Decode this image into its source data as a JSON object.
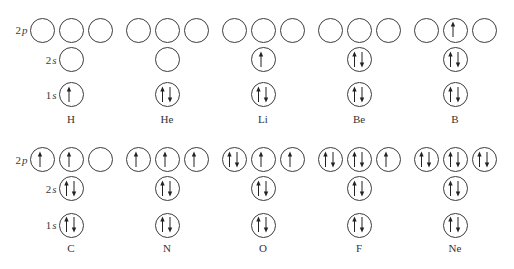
{
  "row_labels": {
    "2p": {
      "n": "2",
      "l": "p"
    },
    "2s": {
      "n": "2",
      "l": "s"
    },
    "1s": {
      "n": "1",
      "l": "s"
    }
  },
  "colors": {
    "circle_stroke": "#3c3c3c",
    "arrow": "#222222",
    "text": "#333333",
    "background": "#ffffff"
  },
  "elements": [
    {
      "symbol": "H",
      "orbitals": {
        "1s": "up",
        "2s": "empty",
        "2p": [
          "empty",
          "empty",
          "empty"
        ]
      }
    },
    {
      "symbol": "He",
      "orbitals": {
        "1s": "updown",
        "2s": "empty",
        "2p": [
          "empty",
          "empty",
          "empty"
        ]
      }
    },
    {
      "symbol": "Li",
      "orbitals": {
        "1s": "updown",
        "2s": "up",
        "2p": [
          "empty",
          "empty",
          "empty"
        ]
      }
    },
    {
      "symbol": "Be",
      "orbitals": {
        "1s": "updown",
        "2s": "updown",
        "2p": [
          "empty",
          "empty",
          "empty"
        ]
      }
    },
    {
      "symbol": "B",
      "orbitals": {
        "1s": "updown",
        "2s": "updown",
        "2p": [
          "empty",
          "up",
          "empty"
        ]
      }
    },
    {
      "symbol": "C",
      "orbitals": {
        "1s": "updown",
        "2s": "updown",
        "2p": [
          "up",
          "up",
          "empty"
        ]
      }
    },
    {
      "symbol": "N",
      "orbitals": {
        "1s": "updown",
        "2s": "updown",
        "2p": [
          "up",
          "up",
          "up"
        ]
      }
    },
    {
      "symbol": "O",
      "orbitals": {
        "1s": "updown",
        "2s": "updown",
        "2p": [
          "updown",
          "up",
          "up"
        ]
      }
    },
    {
      "symbol": "F",
      "orbitals": {
        "1s": "updown",
        "2s": "updown",
        "2p": [
          "updown",
          "updown",
          "up"
        ]
      }
    },
    {
      "symbol": "Ne",
      "orbitals": {
        "1s": "updown",
        "2s": "updown",
        "2p": [
          "updown",
          "updown",
          "updown"
        ]
      }
    }
  ]
}
